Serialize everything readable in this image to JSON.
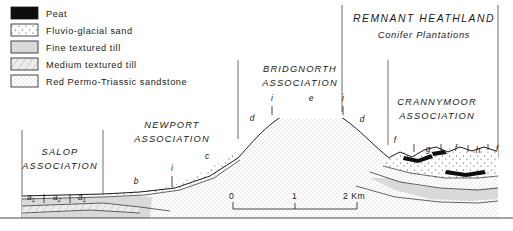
{
  "figure": {
    "type": "geological-cross-section",
    "width": 513,
    "height": 231
  },
  "legend": {
    "items": [
      {
        "label": "Peat",
        "pattern": "solid-black",
        "color": "#0d0d0d"
      },
      {
        "label": "Fluvio-glacial sand",
        "pattern": "sparse-dots",
        "color": "#ffffff"
      },
      {
        "label": "Fine textured till",
        "pattern": "light-gray",
        "color": "#d9d9d9"
      },
      {
        "label": "Medium textured till",
        "pattern": "diagonal-hatch",
        "color": "#e8e8e8"
      },
      {
        "label": "Red Permo-Triassic sandstone",
        "pattern": "fine-stipple",
        "color": "#fafafa"
      }
    ]
  },
  "land_use": {
    "title": "REMNANT HEATHLAND",
    "subtitle": "Conifer Plantations"
  },
  "associations": [
    {
      "name": "SALOP",
      "word2": "ASSOCIATION",
      "x": 60,
      "y": 155
    },
    {
      "name": "NEWPORT",
      "word2": "ASSOCIATION",
      "x": 172,
      "y": 128
    },
    {
      "name": "BRIDGNORTH",
      "word2": "ASSOCIATION",
      "x": 300,
      "y": 72
    },
    {
      "name": "CRANNYMOOR",
      "word2": "ASSOCIATION",
      "x": 437,
      "y": 105
    }
  ],
  "soil_codes": [
    {
      "code": "a",
      "subscript": "1",
      "x": 31,
      "y": 200
    },
    {
      "code": "a",
      "subscript": "2",
      "x": 57,
      "y": 200
    },
    {
      "code": "a",
      "subscript": "1",
      "x": 82,
      "y": 200
    },
    {
      "code": "b",
      "subscript": "",
      "x": 136,
      "y": 184
    },
    {
      "code": "i",
      "subscript": "",
      "x": 172,
      "y": 171
    },
    {
      "code": "c",
      "subscript": "",
      "x": 207,
      "y": 159
    },
    {
      "code": "d",
      "subscript": "",
      "x": 252,
      "y": 121
    },
    {
      "code": "i",
      "subscript": "",
      "x": 272,
      "y": 101
    },
    {
      "code": "e",
      "subscript": "",
      "x": 311,
      "y": 101
    },
    {
      "code": "i",
      "subscript": "",
      "x": 343,
      "y": 101
    },
    {
      "code": "d",
      "subscript": "",
      "x": 362,
      "y": 122
    },
    {
      "code": "f",
      "subscript": "",
      "x": 395,
      "y": 143
    },
    {
      "code": "g",
      "subscript": "",
      "x": 428,
      "y": 152
    },
    {
      "code": "f",
      "subscript": "",
      "x": 456,
      "y": 151
    },
    {
      "code": "h",
      "subscript": "",
      "x": 478,
      "y": 153
    },
    {
      "code": "f",
      "subscript": "",
      "x": 497,
      "y": 152
    }
  ],
  "scale_bar": {
    "start_label": "0",
    "mid_label": "1",
    "end_label": "2 Km"
  }
}
